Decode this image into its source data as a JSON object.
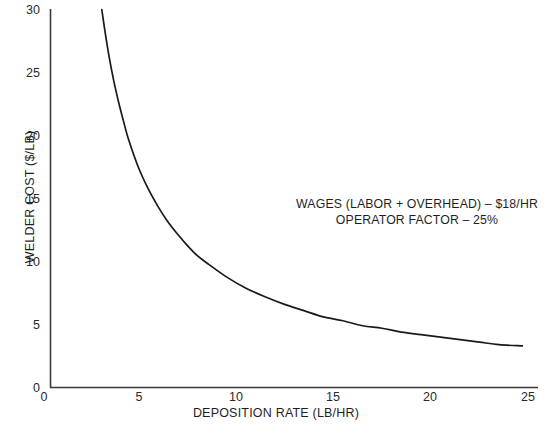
{
  "chart_data": {
    "type": "line",
    "title": "",
    "xlabel": "DEPOSITION RATE (LB/HR)",
    "ylabel": "WELDER COST ($/LB)",
    "xlim": [
      0,
      25
    ],
    "ylim": [
      0,
      30
    ],
    "xticks": [
      0,
      5,
      10,
      15,
      20,
      25
    ],
    "yticks": [
      0,
      5,
      10,
      15,
      20,
      25,
      30
    ],
    "xtick_labels": [
      "0",
      "5",
      "10",
      "15",
      "20",
      "25"
    ],
    "ytick_labels": [
      "0",
      "5",
      "10",
      "15",
      "20",
      "25",
      "30"
    ],
    "grid": false,
    "legend": "none",
    "series": [
      {
        "name": "Welder cost",
        "color": "#1a1a1a",
        "x": [
          2.63,
          2.8,
          3.0,
          3.25,
          3.5,
          3.75,
          4.0,
          4.5,
          5.0,
          5.5,
          6.0,
          6.5,
          7.0,
          7.5,
          8.0,
          9.0,
          10.0,
          11.0,
          12.0,
          13.0,
          14.0,
          15.0,
          16.0,
          17.0,
          18.0,
          19.0,
          20.0,
          21.0,
          22.0,
          23.0,
          24.2
        ],
        "y": [
          30.0,
          28.2,
          26.3,
          24.3,
          22.6,
          21.1,
          19.7,
          17.5,
          15.8,
          14.4,
          13.2,
          12.2,
          11.3,
          10.5,
          9.9,
          8.8,
          7.9,
          7.2,
          6.6,
          6.1,
          5.6,
          5.3,
          4.9,
          4.7,
          4.4,
          4.2,
          4.0,
          3.8,
          3.6,
          3.4,
          3.3
        ],
        "formula_note": "cost = wages / (operator_factor x deposition_rate)"
      }
    ],
    "annotations": [
      "WAGES (LABOR + OVERHEAD) – $18/HR",
      "OPERATOR FACTOR – 25%"
    ]
  },
  "axes": {
    "x_title": "DEPOSITION RATE (LB/HR)",
    "y_title": "WELDER COST ($/LB)",
    "x_ticks": [
      "0",
      "5",
      "10",
      "15",
      "20",
      "25"
    ],
    "y_ticks": [
      "30",
      "25",
      "20",
      "15",
      "10",
      "5",
      "0"
    ]
  },
  "annotation": {
    "line1": "WAGES (LABOR + OVERHEAD) – $18/HR",
    "line2": "OPERATOR FACTOR – 25%"
  },
  "artifact": {
    "bottom_caption": ""
  },
  "colors": {
    "background": "#ffffff",
    "axis": "#3a3a3a",
    "curve": "#1a1a1a",
    "text": "#1f1f1f"
  }
}
